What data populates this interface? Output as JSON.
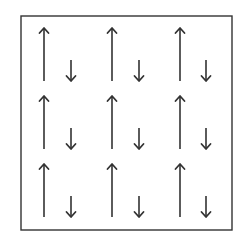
{
  "diagram": {
    "type": "spin-arrow-lattice",
    "stroke_color": "#333333",
    "background": "#ffffff",
    "box": {
      "x": 21,
      "y": 16,
      "width": 211,
      "height": 214
    },
    "rows": 3,
    "cols": 3,
    "col_up_x": [
      44,
      112,
      180
    ],
    "col_down_x": [
      71,
      139,
      206
    ],
    "row_top_y": [
      28,
      96,
      164
    ],
    "row_bottom_y": [
      81,
      149,
      217
    ],
    "down_arrow_length": 21,
    "cells": [
      {
        "row": 0,
        "col": 0,
        "up": "long-up-arrow",
        "down": "short-down-arrow"
      },
      {
        "row": 0,
        "col": 1,
        "up": "long-up-arrow",
        "down": "short-down-arrow"
      },
      {
        "row": 0,
        "col": 2,
        "up": "long-up-arrow",
        "down": "short-down-arrow"
      },
      {
        "row": 1,
        "col": 0,
        "up": "long-up-arrow",
        "down": "short-down-arrow"
      },
      {
        "row": 1,
        "col": 1,
        "up": "long-up-arrow",
        "down": "short-down-arrow"
      },
      {
        "row": 1,
        "col": 2,
        "up": "long-up-arrow",
        "down": "short-down-arrow"
      },
      {
        "row": 2,
        "col": 0,
        "up": "long-up-arrow",
        "down": "short-down-arrow"
      },
      {
        "row": 2,
        "col": 1,
        "up": "long-up-arrow",
        "down": "short-down-arrow"
      },
      {
        "row": 2,
        "col": 2,
        "up": "long-up-arrow",
        "down": "short-down-arrow"
      }
    ]
  }
}
